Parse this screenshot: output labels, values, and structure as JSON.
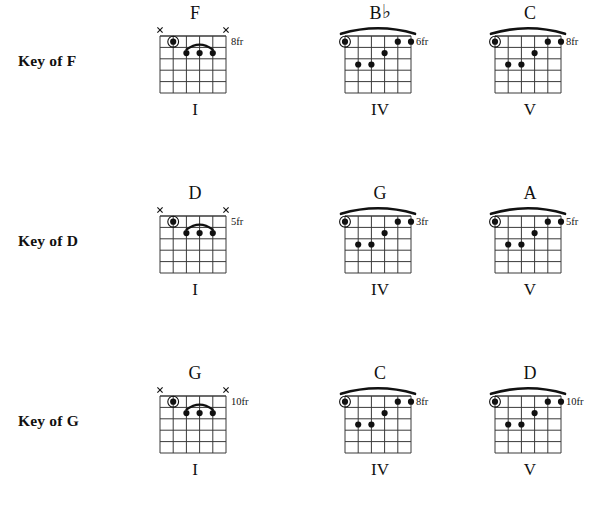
{
  "colors": {
    "ink": "#111111",
    "grid": "#3a3a3a",
    "dot": "#111111",
    "background": "#ffffff"
  },
  "shapes": {
    "f_type": {
      "name": "f-shape",
      "strings": 6,
      "frets": 5,
      "barre": {
        "type": "partial-arc",
        "from_string": 3,
        "to_string": 5,
        "fret": 2
      },
      "root_dot": {
        "string": 2,
        "fret": 1,
        "circled": true
      },
      "dots": [
        {
          "string": 3,
          "fret": 2
        },
        {
          "string": 4,
          "fret": 2
        },
        {
          "string": 5,
          "fret": 2
        }
      ],
      "muted_strings": [
        1,
        6
      ],
      "open_strings": []
    },
    "bflat_type": {
      "name": "barre-shape",
      "strings": 6,
      "frets": 5,
      "barre": {
        "type": "full-arc-above-nut",
        "from_string": 1,
        "to_string": 6,
        "fret": 1
      },
      "root_dot": {
        "string": 1,
        "fret": 1,
        "circled": true
      },
      "dots": [
        {
          "string": 5,
          "fret": 1
        },
        {
          "string": 6,
          "fret": 1
        },
        {
          "string": 4,
          "fret": 2
        },
        {
          "string": 2,
          "fret": 3
        },
        {
          "string": 3,
          "fret": 3
        }
      ],
      "muted_strings": [],
      "open_strings": []
    }
  },
  "rows": [
    {
      "key_label": "Key of F",
      "chords": [
        {
          "name": "F",
          "accidental": "",
          "numeral": "I",
          "fret_label": "8fr",
          "shape": "f_type"
        },
        {
          "name": "B",
          "accidental": "♭",
          "numeral": "IV",
          "fret_label": "6fr",
          "shape": "bflat_type"
        },
        {
          "name": "C",
          "accidental": "",
          "numeral": "V",
          "fret_label": "8fr",
          "shape": "bflat_type"
        }
      ]
    },
    {
      "key_label": "Key of D",
      "chords": [
        {
          "name": "D",
          "accidental": "",
          "numeral": "I",
          "fret_label": "5fr",
          "shape": "f_type"
        },
        {
          "name": "G",
          "accidental": "",
          "numeral": "IV",
          "fret_label": "3fr",
          "shape": "bflat_type"
        },
        {
          "name": "A",
          "accidental": "",
          "numeral": "V",
          "fret_label": "5fr",
          "shape": "bflat_type"
        }
      ]
    },
    {
      "key_label": "Key of G",
      "chords": [
        {
          "name": "G",
          "accidental": "",
          "numeral": "I",
          "fret_label": "10fr",
          "shape": "f_type"
        },
        {
          "name": "C",
          "accidental": "",
          "numeral": "IV",
          "fret_label": "8fr",
          "shape": "bflat_type"
        },
        {
          "name": "D",
          "accidental": "",
          "numeral": "V",
          "fret_label": "10fr",
          "shape": "bflat_type"
        }
      ]
    }
  ]
}
